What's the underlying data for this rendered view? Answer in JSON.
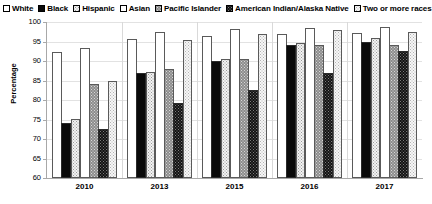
{
  "chart_data": {
    "type": "bar",
    "title": "",
    "xlabel": "",
    "ylabel": "Percentage",
    "ylim": [
      60,
      100
    ],
    "yticks": [
      60,
      65,
      70,
      75,
      80,
      85,
      90,
      95,
      100
    ],
    "grid": true,
    "legend_position": "top",
    "categories": [
      "2010",
      "2013",
      "2015",
      "2016",
      "2017"
    ],
    "series": [
      {
        "name": "White",
        "swatch": "fill-white",
        "values": [
          92.3,
          95.7,
          96.4,
          97.0,
          97.3
        ]
      },
      {
        "name": "Black",
        "swatch": "fill-black",
        "values": [
          74.0,
          87.0,
          90.0,
          94.0,
          95.0
        ]
      },
      {
        "name": "Hispanic",
        "swatch": "fill-dots-light",
        "values": [
          75.2,
          87.2,
          90.5,
          94.5,
          96.0
        ]
      },
      {
        "name": "Asian",
        "swatch": "fill-white2",
        "values": [
          93.3,
          97.5,
          98.3,
          98.5,
          98.6
        ]
      },
      {
        "name": "Pacific Islander",
        "swatch": "fill-gray-dots",
        "values": [
          84.0,
          88.0,
          90.6,
          94.0,
          94.0
        ]
      },
      {
        "name": "American Indian/Alaska Native",
        "swatch": "fill-black-dots",
        "values": [
          72.5,
          79.2,
          82.5,
          87.0,
          92.5
        ]
      },
      {
        "name": "Two or more races",
        "swatch": "fill-dots-lighter",
        "values": [
          85.0,
          95.5,
          96.8,
          98.0,
          97.5
        ]
      }
    ]
  }
}
